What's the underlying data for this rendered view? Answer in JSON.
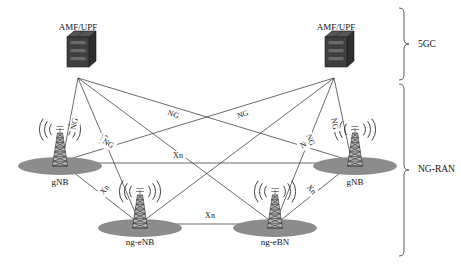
{
  "diagram": {
    "background_color": "#ffffff",
    "line_color": "#2a2a2a",
    "ellipse_color": "#8c8c8c",
    "server_color": "#3a3a3a",
    "brackets": [
      {
        "id": "5gc",
        "label": "5GC",
        "x": 404,
        "y_top": 8,
        "y_bottom": 80,
        "label_x": 418,
        "label_y": 45
      },
      {
        "id": "ng-ran",
        "label": "NG-RAN",
        "x": 404,
        "y_top": 84,
        "y_bottom": 256,
        "label_x": 418,
        "label_y": 170
      }
    ],
    "core_nodes": [
      {
        "id": "amf-upf-left",
        "label": "AMF/UPF",
        "x": 78,
        "y": 52,
        "label_x": 78,
        "label_y": 28,
        "anchor_x": 78,
        "anchor_y": 78
      },
      {
        "id": "amf-upf-right",
        "label": "AMF/UPF",
        "x": 336,
        "y": 52,
        "label_x": 336,
        "label_y": 28,
        "anchor_x": 334,
        "anchor_y": 78
      }
    ],
    "ran_nodes": [
      {
        "id": "gnb-left",
        "label": "gNB",
        "x": 60,
        "y": 160,
        "label_x": 60,
        "label_y": 183,
        "ellipse_rx": 42,
        "ellipse_ry": 9
      },
      {
        "id": "ng-enb-left",
        "label": "ng-eNB",
        "x": 140,
        "y": 222,
        "label_x": 140,
        "label_y": 243,
        "ellipse_rx": 42,
        "ellipse_ry": 9
      },
      {
        "id": "ng-ebn-right",
        "label": "ng-eBN",
        "x": 275,
        "y": 222,
        "label_x": 275,
        "label_y": 243,
        "ellipse_rx": 42,
        "ellipse_ry": 9
      },
      {
        "id": "gnb-right",
        "label": "gNB",
        "x": 355,
        "y": 160,
        "label_x": 355,
        "label_y": 183,
        "ellipse_rx": 42,
        "ellipse_ry": 9
      }
    ],
    "ng_links": [
      {
        "id": "ng-1",
        "from": "amf-upf-left",
        "to": "gnb-left",
        "x1": 78,
        "y1": 78,
        "x2": 62,
        "y2": 163,
        "label": "NG",
        "label_x": 75,
        "label_y": 124,
        "rotate": -80
      },
      {
        "id": "ng-2",
        "from": "amf-upf-left",
        "to": "ng-enb-left",
        "x1": 78,
        "y1": 78,
        "x2": 140,
        "y2": 224,
        "label": "NG",
        "label_x": 104,
        "label_y": 140,
        "rotate": -67
      },
      {
        "id": "ng-3",
        "from": "amf-upf-left",
        "to": "ng-ebn-right",
        "x1": 78,
        "y1": 78,
        "x2": 272,
        "y2": 222,
        "label": "NG",
        "label_x": 243,
        "label_y": 115,
        "rotate": -19
      },
      {
        "id": "ng-4",
        "from": "amf-upf-left",
        "to": "gnb-right",
        "x1": 78,
        "y1": 78,
        "x2": 352,
        "y2": 161,
        "label": "NG",
        "label_x": 306,
        "label_y": 144,
        "rotate": -30
      },
      {
        "id": "ng-5",
        "from": "amf-upf-right",
        "to": "gnb-right",
        "x1": 334,
        "y1": 78,
        "x2": 352,
        "y2": 163,
        "label": "NG",
        "label_x": 334,
        "label_y": 124,
        "rotate": 80
      },
      {
        "id": "ng-6",
        "from": "amf-upf-right",
        "to": "ng-ebn-right",
        "x1": 334,
        "y1": 78,
        "x2": 275,
        "y2": 224,
        "label": "NG",
        "label_x": 310,
        "label_y": 140,
        "rotate": 67
      },
      {
        "id": "ng-7",
        "from": "amf-upf-right",
        "to": "ng-enb-left",
        "x1": 334,
        "y1": 78,
        "x2": 142,
        "y2": 222,
        "label": "NG",
        "label_x": 173,
        "label_y": 115,
        "rotate": 19
      },
      {
        "id": "ng-8",
        "from": "amf-upf-right",
        "to": "gnb-left",
        "x1": 334,
        "y1": 78,
        "x2": 63,
        "y2": 161,
        "label": "NG",
        "label_x": 108,
        "label_y": 144,
        "rotate": 30
      }
    ],
    "xn_links": [
      {
        "id": "xn-gnb-gnb",
        "from": "gnb-left",
        "to": "gnb-right",
        "x1": 62,
        "y1": 163,
        "x2": 352,
        "y2": 163,
        "label": "Xn",
        "label_x": 178,
        "label_y": 156,
        "rotate": 0
      },
      {
        "id": "xn-gnb-ngenb",
        "from": "gnb-left",
        "to": "ng-enb-left",
        "x1": 64,
        "y1": 165,
        "x2": 140,
        "y2": 224,
        "label": "Xn",
        "label_x": 105,
        "label_y": 190,
        "rotate": -50
      },
      {
        "id": "xn-ngenb-ngebn",
        "from": "ng-enb-left",
        "to": "ng-ebn-right",
        "x1": 142,
        "y1": 224,
        "x2": 273,
        "y2": 224,
        "label": "Xn",
        "label_x": 210,
        "label_y": 216,
        "rotate": 0
      },
      {
        "id": "xn-gnbr-ngebn",
        "from": "gnb-right",
        "to": "ng-ebn-right",
        "x1": 350,
        "y1": 165,
        "x2": 276,
        "y2": 224,
        "label": "Xn",
        "label_x": 311,
        "label_y": 190,
        "rotate": 50
      }
    ]
  }
}
